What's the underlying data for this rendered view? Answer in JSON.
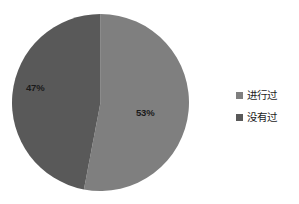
{
  "chart_data": {
    "type": "pie",
    "title": "",
    "subtitle": "",
    "xlabel": "",
    "ylabel": "",
    "grid": false,
    "legend_position": "right",
    "start_angle_oclock": 12,
    "direction": "clockwise",
    "categories": [
      "进行过",
      "没有过"
    ],
    "values": [
      53,
      47
    ],
    "value_unit": "%",
    "data_labels": [
      "53%",
      "47%"
    ],
    "colors": [
      "#7f7f7f",
      "#595959"
    ],
    "background_color": "#ffffff",
    "label_text_color": "#1a1a1a",
    "slices": [
      {
        "name": "进行过",
        "value": 53,
        "label": "53%",
        "color": "#7f7f7f"
      },
      {
        "name": "没有过",
        "value": 47,
        "label": "47%",
        "color": "#595959"
      }
    ]
  },
  "legend": {
    "items": [
      {
        "label": "进行过",
        "color": "#7f7f7f",
        "marker": "square-marker-icon"
      },
      {
        "label": "没有过",
        "color": "#595959",
        "marker": "square-marker-icon"
      }
    ]
  }
}
